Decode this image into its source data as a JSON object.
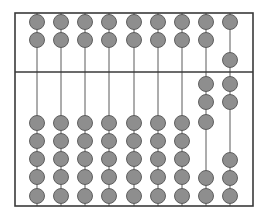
{
  "diagram": {
    "type": "abacus",
    "frame": {
      "left": 15,
      "top": 13,
      "right": 253,
      "bottom": 206
    },
    "divider_y": 72,
    "bead_radius": 7.5,
    "colors": {
      "bead_fill": "#8e8e8e",
      "bead_stroke": "#555555",
      "frame": "#3a3a3a",
      "rod": "#5a5a5a"
    },
    "rods": [
      {
        "x": 37,
        "upper_beads_y": [
          22,
          40
        ],
        "lower_beads_y": [
          123,
          141,
          159,
          177,
          196
        ]
      },
      {
        "x": 61,
        "upper_beads_y": [
          22,
          40
        ],
        "lower_beads_y": [
          123,
          141,
          159,
          177,
          196
        ]
      },
      {
        "x": 85,
        "upper_beads_y": [
          22,
          40
        ],
        "lower_beads_y": [
          123,
          141,
          159,
          177,
          196
        ]
      },
      {
        "x": 109,
        "upper_beads_y": [
          22,
          40
        ],
        "lower_beads_y": [
          123,
          141,
          159,
          177,
          196
        ]
      },
      {
        "x": 134,
        "upper_beads_y": [
          22,
          40
        ],
        "lower_beads_y": [
          123,
          141,
          159,
          177,
          196
        ]
      },
      {
        "x": 158,
        "upper_beads_y": [
          22,
          40
        ],
        "lower_beads_y": [
          123,
          141,
          159,
          177,
          196
        ]
      },
      {
        "x": 182,
        "upper_beads_y": [
          22,
          40
        ],
        "lower_beads_y": [
          123,
          141,
          159,
          177,
          196
        ]
      },
      {
        "x": 206,
        "upper_beads_y": [
          22,
          40
        ],
        "lower_beads_y": [
          84,
          102,
          122,
          178,
          196
        ]
      },
      {
        "x": 230,
        "upper_beads_y": [
          22,
          60
        ],
        "lower_beads_y": [
          84,
          102,
          160,
          178,
          196
        ]
      }
    ]
  }
}
